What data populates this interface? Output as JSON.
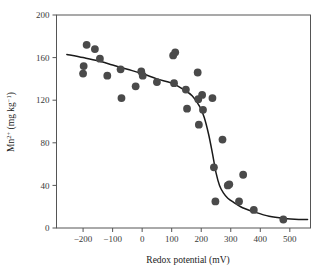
{
  "figure": {
    "background": "#ffffff",
    "point_color": "#4a4a4a",
    "curve_color": "#1a1a1a",
    "axis_color": "#555555"
  },
  "axes": {
    "x": {
      "title": "Redox potential (mV)",
      "ticks": [
        "-200",
        "-100",
        "0",
        "100",
        "200",
        "300",
        "400",
        "500"
      ],
      "tick_values": [
        -200,
        -100,
        0,
        100,
        200,
        300,
        400,
        500
      ],
      "min": -290,
      "max": 570
    },
    "y": {
      "title_main": "Mn",
      "title_sup": "2+",
      "title_unit": " (mg kg",
      "title_unit_sup": "−1",
      "title_unit_close": ")",
      "title_plain": "Mn2+ (mg kg-1)",
      "ticks": [
        "0",
        "40",
        "80",
        "120",
        "160",
        "200"
      ],
      "tick_values": [
        0,
        40,
        80,
        120,
        160,
        200
      ],
      "min": 0,
      "max": 200
    }
  },
  "chart_data": {
    "type": "scatter",
    "title": "",
    "xlabel": "Redox potential (mV)",
    "ylabel": "Mn2+ (mg kg-1)",
    "xlim": [
      -290,
      570
    ],
    "ylim": [
      0,
      200
    ],
    "grid": false,
    "legend": "none",
    "marker": {
      "shape": "circle",
      "size": 5.4,
      "color": "#4a4a4a"
    },
    "points": [
      {
        "x": -198,
        "y": 152
      },
      {
        "x": -200,
        "y": 145
      },
      {
        "x": -188,
        "y": 172
      },
      {
        "x": -160,
        "y": 168
      },
      {
        "x": -143,
        "y": 159
      },
      {
        "x": -118,
        "y": 143
      },
      {
        "x": -73,
        "y": 149
      },
      {
        "x": -70,
        "y": 122
      },
      {
        "x": -22,
        "y": 133
      },
      {
        "x": -3,
        "y": 147
      },
      {
        "x": 2,
        "y": 143
      },
      {
        "x": 50,
        "y": 137
      },
      {
        "x": 105,
        "y": 162
      },
      {
        "x": 112,
        "y": 165
      },
      {
        "x": 108,
        "y": 136
      },
      {
        "x": 148,
        "y": 130
      },
      {
        "x": 152,
        "y": 112
      },
      {
        "x": 188,
        "y": 146
      },
      {
        "x": 190,
        "y": 121
      },
      {
        "x": 192,
        "y": 97
      },
      {
        "x": 203,
        "y": 125
      },
      {
        "x": 206,
        "y": 111
      },
      {
        "x": 238,
        "y": 122
      },
      {
        "x": 243,
        "y": 57
      },
      {
        "x": 248,
        "y": 25
      },
      {
        "x": 272,
        "y": 83
      },
      {
        "x": 290,
        "y": 40
      },
      {
        "x": 295,
        "y": 41
      },
      {
        "x": 328,
        "y": 25
      },
      {
        "x": 342,
        "y": 50
      },
      {
        "x": 378,
        "y": 17
      },
      {
        "x": 478,
        "y": 8
      }
    ],
    "fit_curve": {
      "description": "sigmoid fit, high Mn at low redox potential dropping to near zero above ~300 mV",
      "points": [
        {
          "x": -255,
          "y": 163
        },
        {
          "x": -200,
          "y": 160
        },
        {
          "x": -150,
          "y": 157
        },
        {
          "x": -100,
          "y": 153
        },
        {
          "x": -50,
          "y": 149
        },
        {
          "x": 0,
          "y": 145
        },
        {
          "x": 50,
          "y": 140
        },
        {
          "x": 100,
          "y": 136
        },
        {
          "x": 140,
          "y": 130
        },
        {
          "x": 170,
          "y": 124
        },
        {
          "x": 195,
          "y": 114
        },
        {
          "x": 210,
          "y": 104
        },
        {
          "x": 225,
          "y": 88
        },
        {
          "x": 238,
          "y": 70
        },
        {
          "x": 250,
          "y": 52
        },
        {
          "x": 262,
          "y": 40
        },
        {
          "x": 275,
          "y": 33
        },
        {
          "x": 290,
          "y": 28
        },
        {
          "x": 310,
          "y": 24
        },
        {
          "x": 340,
          "y": 19
        },
        {
          "x": 380,
          "y": 15
        },
        {
          "x": 430,
          "y": 11
        },
        {
          "x": 480,
          "y": 9
        },
        {
          "x": 530,
          "y": 8
        },
        {
          "x": 560,
          "y": 8
        }
      ]
    }
  }
}
